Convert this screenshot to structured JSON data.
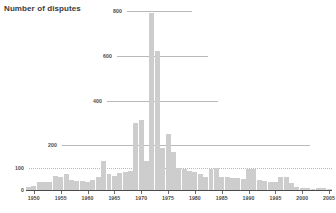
{
  "chart_data": {
    "type": "bar",
    "title": "Number of disputes",
    "xlabel": "",
    "ylabel": "Number of disputes",
    "ylim": [
      0,
      800
    ],
    "xlim": [
      1949,
      2005
    ],
    "grid": true,
    "legend": null,
    "bar_color": "#cdcdcd",
    "axis_color": "#4a4a4a",
    "grid_color": "#b9b9b9",
    "ytick_labels": [
      "0",
      "100",
      "200",
      "400",
      "600",
      "800"
    ],
    "ytick_values": [
      0,
      100,
      200,
      400,
      600,
      800
    ],
    "xtick_labels": [
      "1950",
      "1955",
      "1960",
      "1965",
      "1970",
      "1975",
      "1980",
      "1985",
      "1990",
      "1995",
      "2000",
      "2005"
    ],
    "xtick_values": [
      1950,
      1955,
      1960,
      1965,
      1970,
      1975,
      1980,
      1985,
      1990,
      1995,
      2000,
      2005
    ],
    "categories": [
      1949,
      1950,
      1951,
      1952,
      1953,
      1954,
      1955,
      1956,
      1957,
      1958,
      1959,
      1960,
      1961,
      1962,
      1963,
      1964,
      1965,
      1966,
      1967,
      1968,
      1969,
      1970,
      1971,
      1972,
      1973,
      1974,
      1975,
      1976,
      1977,
      1978,
      1979,
      1980,
      1981,
      1982,
      1983,
      1984,
      1985,
      1986,
      1987,
      1988,
      1989,
      1990,
      1991,
      1992,
      1993,
      1994,
      1995,
      1996,
      1997,
      1998,
      1999,
      2000,
      2001,
      2002,
      2003,
      2004,
      2005
    ],
    "values": [
      12,
      20,
      34,
      36,
      38,
      62,
      58,
      72,
      44,
      40,
      42,
      38,
      46,
      60,
      128,
      70,
      62,
      74,
      82,
      84,
      300,
      312,
      128,
      790,
      620,
      190,
      250,
      168,
      100,
      92,
      84,
      80,
      72,
      60,
      96,
      98,
      56,
      58,
      54,
      52,
      50,
      92,
      92,
      44,
      40,
      38,
      36,
      58,
      56,
      30,
      14,
      10,
      8,
      6,
      10,
      8,
      6
    ]
  }
}
